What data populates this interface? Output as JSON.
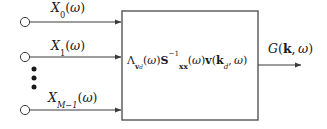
{
  "diagram": {
    "type": "block-diagram",
    "background_color": "#ffffff",
    "line_color": "#3a3a3a",
    "text_color": "#1a1a1a",
    "inputs": [
      {
        "id": "input-0",
        "label": "X_0(omega)",
        "label_parts": {
          "symbol": "X",
          "subscript": "0",
          "argument": "ω"
        },
        "terminal_shape": "circle-open"
      },
      {
        "id": "input-1",
        "label": "X_1(omega)",
        "label_parts": {
          "symbol": "X",
          "subscript": "1",
          "argument": "ω"
        },
        "terminal_shape": "circle-open"
      },
      {
        "id": "input-m-1",
        "label": "X_{M-1}(omega)",
        "label_parts": {
          "symbol": "X",
          "subscript": "M−1",
          "argument": "ω"
        },
        "terminal_shape": "circle-open"
      }
    ],
    "ellipsis": {
      "glyph": "⋮",
      "dot_count": 3,
      "orientation": "vertical"
    },
    "block": {
      "id": "processing-block",
      "formula": "Λ_{v_d}(ω) S_{xx}^{-1}(ω) v(k_d, ω)",
      "formula_parts": {
        "lambda": "Λ",
        "lambda_sub_vec": "v",
        "lambda_sub_idx": "d",
        "arg1": "ω",
        "matrix": "S",
        "matrix_sub": "xx",
        "matrix_sup": "−1",
        "arg2": "ω",
        "steering": "v",
        "steering_vec": "k",
        "steering_idx": "d",
        "arg3": "ω"
      }
    },
    "output": {
      "id": "output-0",
      "label": "G(k, omega)",
      "label_parts": {
        "symbol": "G",
        "vector": "k",
        "argument": "ω"
      }
    }
  }
}
